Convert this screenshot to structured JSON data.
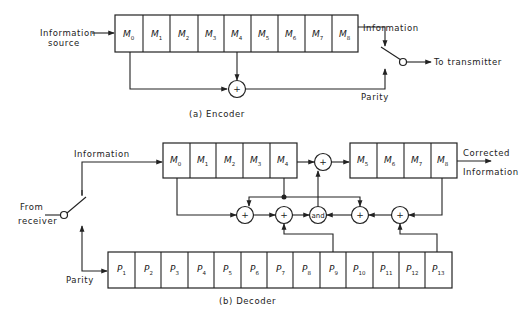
{
  "encoder": {
    "caption": "(a) Encoder",
    "input_label_line1": "Information",
    "input_label_line2": "source",
    "register_cells": [
      {
        "sym": "M",
        "sub": "0"
      },
      {
        "sym": "M",
        "sub": "1"
      },
      {
        "sym": "M",
        "sub": "2"
      },
      {
        "sym": "M",
        "sub": "3"
      },
      {
        "sym": "M",
        "sub": "4"
      },
      {
        "sym": "M",
        "sub": "5"
      },
      {
        "sym": "M",
        "sub": "6"
      },
      {
        "sym": "M",
        "sub": "7"
      },
      {
        "sym": "M",
        "sub": "8"
      }
    ],
    "adder_symbol": "+",
    "information_label": "Information",
    "parity_label": "Parity",
    "output_label": "To transmitter"
  },
  "decoder": {
    "caption": "(b) Decoder",
    "input_label_line1": "From",
    "input_label_line2": "receiver",
    "information_label": "Information",
    "parity_label": "Parity",
    "output_label_line1": "Corrected",
    "output_label_line2": "Information",
    "upper_register_cells": [
      {
        "sym": "M",
        "sub": "0"
      },
      {
        "sym": "M",
        "sub": "1"
      },
      {
        "sym": "M",
        "sub": "2"
      },
      {
        "sym": "M",
        "sub": "3"
      },
      {
        "sym": "M",
        "sub": "4"
      }
    ],
    "lower_register_cells": [
      {
        "sym": "M",
        "sub": "5"
      },
      {
        "sym": "M",
        "sub": "6"
      },
      {
        "sym": "M",
        "sub": "7"
      },
      {
        "sym": "M",
        "sub": "8"
      }
    ],
    "parity_register_cells": [
      {
        "sym": "P",
        "sub": "1"
      },
      {
        "sym": "P",
        "sub": "2"
      },
      {
        "sym": "P",
        "sub": "3"
      },
      {
        "sym": "P",
        "sub": "4"
      },
      {
        "sym": "P",
        "sub": "5"
      },
      {
        "sym": "P",
        "sub": "6"
      },
      {
        "sym": "P",
        "sub": "7"
      },
      {
        "sym": "P",
        "sub": "8"
      },
      {
        "sym": "P",
        "sub": "9"
      },
      {
        "sym": "P",
        "sub": "10"
      },
      {
        "sym": "P",
        "sub": "11"
      },
      {
        "sym": "P",
        "sub": "12"
      },
      {
        "sym": "P",
        "sub": "13"
      }
    ],
    "adder_symbol": "+",
    "and_gate_label": "and"
  }
}
